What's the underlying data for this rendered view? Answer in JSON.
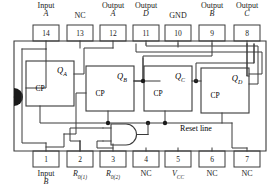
{
  "diagram": {
    "device": "4-bit ripple counter IC",
    "line_color": "#333333",
    "text_color": "#1a1a1a",
    "background": "#ffffff"
  },
  "pins_top": [
    {
      "number": "14",
      "line1": "Input",
      "line2": "A",
      "line2_italic": true,
      "cx": 46
    },
    {
      "number": "13",
      "line1": "NC",
      "line2": "",
      "line2_italic": false,
      "cx": 80
    },
    {
      "number": "12",
      "line1": "Output",
      "line2": "A",
      "line2_italic": true,
      "cx": 113
    },
    {
      "number": "11",
      "line1": "Output",
      "line2": "D",
      "line2_italic": true,
      "cx": 146
    },
    {
      "number": "10",
      "line1": "GND",
      "line2": "",
      "line2_italic": false,
      "cx": 178
    },
    {
      "number": "9",
      "line1": "Output",
      "line2": "B",
      "line2_italic": true,
      "cx": 212
    },
    {
      "number": "8",
      "line1": "Output",
      "line2": "C",
      "line2_italic": true,
      "cx": 247
    }
  ],
  "pins_bottom": [
    {
      "number": "1",
      "line1": "Input",
      "line2": "B",
      "line2_italic": true,
      "sub": "",
      "cx": 46
    },
    {
      "number": "2",
      "line1": "R",
      "line2": "",
      "line2_italic": true,
      "sub": "0(1)",
      "cx": 80
    },
    {
      "number": "3",
      "line1": "R",
      "line2": "",
      "line2_italic": true,
      "sub": "0(2)",
      "cx": 113
    },
    {
      "number": "4",
      "line1": "NC",
      "line2": "",
      "line2_italic": false,
      "sub": "",
      "cx": 146
    },
    {
      "number": "5",
      "line1": "V",
      "line2": "",
      "line2_italic": true,
      "sub": "CC",
      "cx": 178
    },
    {
      "number": "6",
      "line1": "NC",
      "line2": "",
      "line2_italic": false,
      "sub": "",
      "cx": 212
    },
    {
      "number": "7",
      "line1": "NC",
      "line2": "",
      "line2_italic": false,
      "sub": "",
      "cx": 247
    }
  ],
  "flipflops": [
    {
      "id": "ff-a",
      "clock_label": "CP",
      "output_label": "Q",
      "output_sub": "A",
      "x": 26,
      "y": 61,
      "w": 48,
      "h": 45
    },
    {
      "id": "ff-b",
      "clock_label": "CP",
      "output_label": "Q",
      "output_sub": "B",
      "x": 86,
      "y": 66,
      "w": 48,
      "h": 45
    },
    {
      "id": "ff-c",
      "clock_label": "CP",
      "output_label": "Q",
      "output_sub": "C",
      "x": 144,
      "y": 66,
      "w": 48,
      "h": 45
    },
    {
      "id": "ff-d",
      "clock_label": "CP",
      "output_label": "Q",
      "output_sub": "D",
      "x": 201,
      "y": 68,
      "w": 48,
      "h": 45
    }
  ],
  "annotations": {
    "reset_line": "Reset line"
  },
  "gates": [
    {
      "id": "and-gate-reset",
      "type": "AND",
      "inputs": 2
    }
  ]
}
